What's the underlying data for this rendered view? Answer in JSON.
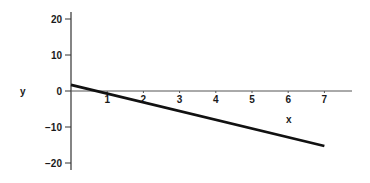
{
  "chart_data": {
    "type": "line",
    "title": "",
    "xlabel": "x",
    "ylabel": "y",
    "xlim": [
      0,
      8
    ],
    "ylim": [
      -22,
      22
    ],
    "x_ticks": [
      1,
      2,
      3,
      4,
      5,
      6,
      7
    ],
    "y_ticks": [
      20,
      10,
      0,
      -10,
      -20
    ],
    "x_tick_labels": [
      "1",
      "2",
      "3",
      "4",
      "5",
      "6",
      "7"
    ],
    "y_tick_labels": [
      "20",
      "10",
      "0",
      "−10",
      "−20"
    ],
    "grid": false,
    "legend": null,
    "series": [
      {
        "name": "line",
        "color": "#111111",
        "x": [
          0,
          7
        ],
        "y": [
          1.7,
          -15.3
        ]
      }
    ]
  },
  "colors": {
    "axis": "#333333",
    "line": "#111111",
    "background": "#ffffff"
  }
}
